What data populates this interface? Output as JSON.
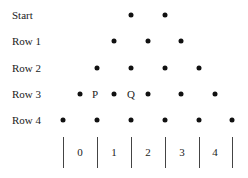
{
  "rows": [
    {
      "label": "Start"
    },
    {
      "label": "Row 1"
    },
    {
      "label": "Row 2"
    },
    {
      "label": "Row 3"
    },
    {
      "label": "Row 4"
    }
  ],
  "markers": {
    "p": "P",
    "q": "Q"
  },
  "bins": [
    "0",
    "1",
    "2",
    "3",
    "4"
  ]
}
